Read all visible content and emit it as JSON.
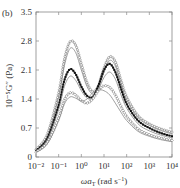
{
  "panel_label": "(b)",
  "chart_data": {
    "type": "line",
    "title": "",
    "xlabel": "ωa_T (rad s⁻¹)",
    "ylabel": "10⁻⁵G″ (Pa)",
    "xscale": "log",
    "xlim": [
      0.01,
      10000
    ],
    "ylim": [
      0,
      3.5
    ],
    "x_ticks": [
      "10⁻²",
      "10⁻¹",
      "10⁰",
      "10¹",
      "10²",
      "10³",
      "10⁴"
    ],
    "y_ticks": [
      "0",
      "0.7",
      "1.4",
      "2.1",
      "2.8",
      "3.5"
    ],
    "grid": false,
    "legend": null,
    "x_log10": [
      -2.0,
      -1.5,
      -1.0,
      -0.75,
      -0.5,
      -0.25,
      0.0,
      0.25,
      0.5,
      0.75,
      1.0,
      1.25,
      1.5,
      1.75,
      2.0,
      2.5,
      3.0,
      3.5,
      4.0
    ],
    "series": [
      {
        "name": "S1 (open circles)",
        "marker": "open-circle",
        "values": [
          0.18,
          0.55,
          1.55,
          2.35,
          2.78,
          2.7,
          2.25,
          1.8,
          1.58,
          1.72,
          2.15,
          2.42,
          2.3,
          1.85,
          1.45,
          1.0,
          0.8,
          0.68,
          0.6
        ]
      },
      {
        "name": "S2 (line)",
        "marker": "none",
        "values": [
          0.16,
          0.5,
          1.45,
          2.2,
          2.62,
          2.52,
          2.1,
          1.7,
          1.52,
          1.65,
          2.05,
          2.33,
          2.2,
          1.78,
          1.38,
          0.95,
          0.76,
          0.64,
          0.56
        ]
      },
      {
        "name": "S3 (filled squares)",
        "marker": "filled-square",
        "values": [
          0.15,
          0.45,
          1.25,
          1.85,
          2.12,
          2.0,
          1.7,
          1.48,
          1.45,
          1.72,
          2.1,
          2.25,
          2.05,
          1.65,
          1.28,
          0.88,
          0.7,
          0.58,
          0.5
        ]
      },
      {
        "name": "S4 (line)",
        "marker": "none",
        "values": [
          0.14,
          0.42,
          1.15,
          1.7,
          1.95,
          1.85,
          1.6,
          1.42,
          1.42,
          1.62,
          1.92,
          2.05,
          1.88,
          1.5,
          1.18,
          0.8,
          0.63,
          0.53,
          0.46
        ]
      },
      {
        "name": "S5 (open markers)",
        "marker": "open-diamond",
        "values": [
          0.12,
          0.35,
          0.95,
          1.38,
          1.55,
          1.5,
          1.36,
          1.3,
          1.4,
          1.6,
          1.72,
          1.68,
          1.5,
          1.22,
          0.98,
          0.68,
          0.54,
          0.46,
          0.4
        ]
      },
      {
        "name": "S6 (line)",
        "marker": "none",
        "values": [
          0.11,
          0.32,
          0.88,
          1.28,
          1.45,
          1.42,
          1.35,
          1.4,
          1.55,
          1.62,
          1.6,
          1.5,
          1.3,
          1.08,
          0.88,
          0.62,
          0.5,
          0.42,
          0.37
        ]
      }
    ]
  },
  "axes": {
    "x_label_main": "ωa",
    "x_label_sub": "T",
    "x_label_unit": " (rad s",
    "x_label_exp": "−1",
    "x_label_close": ")",
    "y_label_text": "10⁻⁵G″ (Pa)"
  }
}
